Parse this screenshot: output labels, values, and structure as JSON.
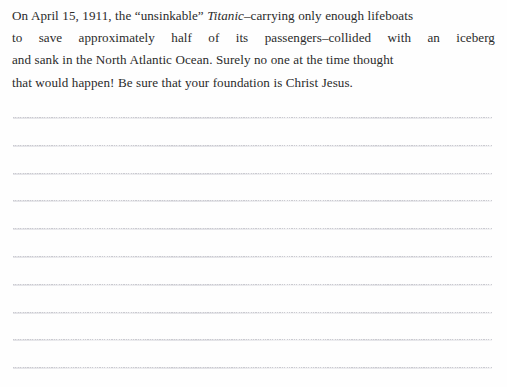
{
  "document": {
    "type": "devotional-journal-page",
    "background_color": "#fefefe",
    "text_color": "#2b2b2b",
    "rule_color": "#c9c9cf"
  },
  "passage": {
    "full_text": "On April 15, 1911, the “unsinkable” Titanic–carrying only enough lifeboats to save approximately half of its passengers–collided with an iceberg and sank in the North Atlantic Ocean. Surely no one at the time thought that would happen! Be sure that your foundation is Christ Jesus.",
    "lines": [
      {
        "segments": [
          {
            "text": "On April 15, 1911, the “unsinkable” ",
            "style": "normal"
          },
          {
            "text": "Titanic",
            "style": "italic"
          },
          {
            "text": "–carrying only enough lifeboats",
            "style": "normal"
          }
        ]
      },
      {
        "justified": true,
        "words": [
          "to",
          "save",
          "approximately",
          "half",
          "of",
          "its",
          "passengers–collided",
          "with",
          "an",
          "iceberg"
        ]
      },
      {
        "segments": [
          {
            "text": "and sank in the North Atlantic Ocean. Surely no one at the time thought",
            "style": "normal"
          }
        ]
      },
      {
        "segments": [
          {
            "text": "that would happen! Be sure that your foundation is Christ Jesus.",
            "style": "normal"
          }
        ]
      }
    ],
    "emphasis": {
      "italic_word": "Titanic"
    }
  },
  "writing_area": {
    "label": "ruled-writing-lines",
    "line_count": 10,
    "first_line_y": 117,
    "line_spacing": 27.8,
    "left": 13,
    "right": 492
  }
}
